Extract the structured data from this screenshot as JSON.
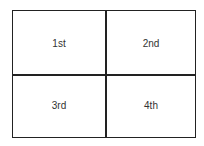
{
  "diagram": {
    "type": "2x2 grid",
    "cells": [
      {
        "label": "1st",
        "position": "top-left"
      },
      {
        "label": "2nd",
        "position": "top-right"
      },
      {
        "label": "3rd",
        "position": "bottom-left"
      },
      {
        "label": "4th",
        "position": "bottom-right"
      }
    ]
  }
}
